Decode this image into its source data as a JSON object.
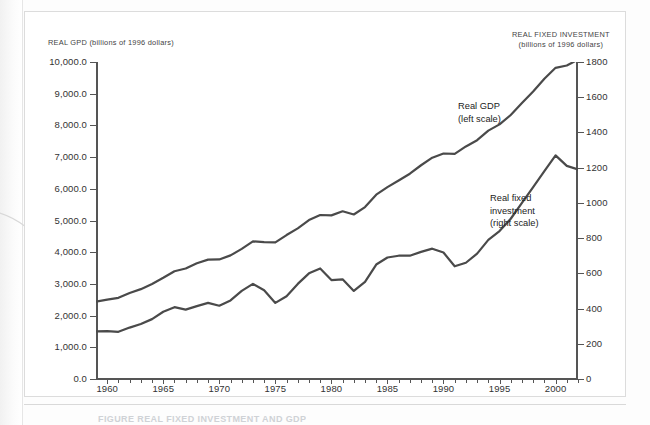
{
  "figure": {
    "caption": "FIGURE   REAL FIXED INVESTMENT AND GDP"
  },
  "chart_data": {
    "type": "line",
    "title": "",
    "xlabel": "",
    "grid": false,
    "legend_position": "inline-annotations",
    "x": [
      1959,
      1960,
      1961,
      1962,
      1963,
      1964,
      1965,
      1966,
      1967,
      1968,
      1969,
      1970,
      1971,
      1972,
      1973,
      1974,
      1975,
      1976,
      1977,
      1978,
      1979,
      1980,
      1981,
      1982,
      1983,
      1984,
      1985,
      1986,
      1987,
      1988,
      1989,
      1990,
      1991,
      1992,
      1993,
      1994,
      1995,
      1996,
      1997,
      1998,
      1999,
      2000,
      2001,
      2002
    ],
    "x_ticks": [
      1960,
      1965,
      1970,
      1975,
      1980,
      1985,
      1990,
      1995,
      2000
    ],
    "axes": {
      "left": {
        "label": "REAL GPD (billions of 1996 dollars)",
        "ticks": [
          "0.0",
          "1,000.0",
          "2,000.0",
          "3,000.0",
          "4,000.0",
          "5,000.0",
          "6,000.0",
          "7,000.0",
          "8,000.0",
          "9,000.0",
          "10,000.0"
        ],
        "min": 0,
        "max": 10000,
        "step": 1000
      },
      "right": {
        "label_line1": "REAL FIXED INVESTMENT",
        "label_line2": "(billions of 1996 dollars)",
        "ticks": [
          "0",
          "200",
          "400",
          "600",
          "800",
          "1000",
          "1200",
          "1400",
          "1600",
          "1800"
        ],
        "min": 0,
        "max": 1800,
        "step": 200
      }
    },
    "series": [
      {
        "name": "Real GDP",
        "annotation_line1": "Real GDP",
        "annotation_line2": "(left scale)",
        "axis": "left",
        "color": "#4a4a4a",
        "values": [
          2442,
          2502,
          2560,
          2715,
          2834,
          2999,
          3192,
          3399,
          3485,
          3653,
          3766,
          3772,
          3899,
          4105,
          4342,
          4320,
          4311,
          4541,
          4751,
          5015,
          5173,
          5162,
          5292,
          5189,
          5424,
          5814,
          6054,
          6264,
          6475,
          6743,
          6981,
          7113,
          7101,
          7337,
          7533,
          7836,
          8032,
          8329,
          8704,
          9067,
          9470,
          9817,
          9891,
          10075
        ]
      },
      {
        "name": "Real fixed investment",
        "annotation_line1": "Real fixed",
        "annotation_line2": "investment",
        "annotation_line3": "(right scale)",
        "axis": "right",
        "color": "#4a4a4a",
        "values": [
          270,
          272,
          268,
          292,
          312,
          340,
          382,
          408,
          394,
          414,
          432,
          416,
          446,
          500,
          540,
          504,
          432,
          470,
          540,
          600,
          628,
          562,
          566,
          500,
          552,
          650,
          690,
          700,
          700,
          722,
          740,
          718,
          640,
          660,
          712,
          790,
          840,
          910,
          1000,
          1090,
          1180,
          1270,
          1210,
          1190
        ]
      }
    ],
    "annotations": [
      {
        "text": "Real GDP (left scale)",
        "near_year": 1998
      },
      {
        "text": "Real fixed investment (right scale)",
        "near_year": 1999
      }
    ]
  }
}
